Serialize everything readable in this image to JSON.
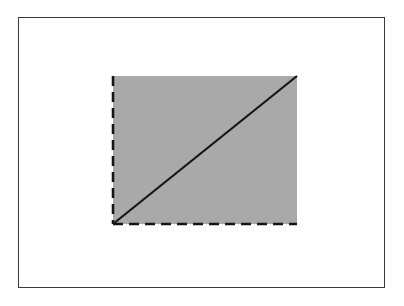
{
  "figure": {
    "type": "geometric-diagram",
    "canvas": {
      "width": 404,
      "height": 306,
      "background_color": "#ffffff"
    },
    "frame": {
      "name": "outer-border",
      "x": 18,
      "y": 17,
      "width": 367,
      "height": 271,
      "stroke_color": "#3a3a3a",
      "stroke_width": 1.4,
      "fill_color": "#ffffff"
    },
    "rectangle": {
      "name": "shaded-rectangle",
      "x": 113,
      "y": 76,
      "width": 184,
      "height": 148,
      "fill_color": "#a9a9a9",
      "corners": {
        "top_left": [
          113,
          76
        ],
        "top_right": [
          297,
          76
        ],
        "bottom_right": [
          297,
          224
        ],
        "bottom_left": [
          113,
          224
        ]
      }
    },
    "edges": [
      {
        "name": "left-edge",
        "style": "dashed",
        "x1": 113,
        "y1": 76,
        "x2": 113,
        "y2": 224,
        "stroke_color": "#151515",
        "stroke_width": 2.6,
        "dash_length": 10,
        "gap_length": 6
      },
      {
        "name": "bottom-edge",
        "style": "dashed",
        "x1": 113,
        "y1": 224,
        "x2": 297,
        "y2": 224,
        "stroke_color": "#151515",
        "stroke_width": 2.6,
        "dash_length": 10,
        "gap_length": 6
      },
      {
        "name": "top-edge",
        "style": "none",
        "x1": 113,
        "y1": 76,
        "x2": 297,
        "y2": 76,
        "stroke_color": "none",
        "stroke_width": 0
      },
      {
        "name": "right-edge",
        "style": "none",
        "x1": 297,
        "y1": 76,
        "x2": 297,
        "y2": 224,
        "stroke_color": "none",
        "stroke_width": 0
      }
    ],
    "diagonal": {
      "name": "diagonal-line",
      "style": "solid",
      "x1": 113,
      "y1": 224,
      "x2": 297,
      "y2": 76,
      "stroke_color": "#151515",
      "stroke_width": 2.2,
      "direction": "bottom-left-to-top-right"
    }
  }
}
